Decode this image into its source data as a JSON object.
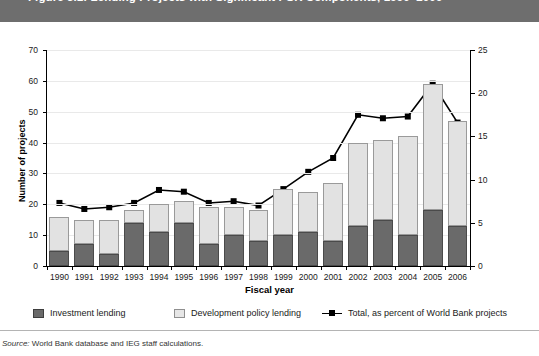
{
  "figure": {
    "title": "Figure 5.1: Lending Projects with Significant PSR Components, 1990–2006",
    "source_label": "Source:",
    "source_text": "World Bank database and IEG staff calculations."
  },
  "axes": {
    "x_title": "Fiscal year",
    "y_left_title": "Number of projects",
    "y_right_title": "Percent of Bank projects",
    "y_left_ticks": [
      "0",
      "10",
      "20",
      "30",
      "40",
      "50",
      "60",
      "70"
    ],
    "y_right_ticks": [
      "0",
      "5",
      "10",
      "15",
      "20",
      "25"
    ]
  },
  "legend": {
    "items": [
      {
        "label": "Investment lending",
        "marker": "square-swatch-dark",
        "color": "#6a6a6a"
      },
      {
        "label": "Development policy lending",
        "marker": "square-swatch-light",
        "color": "#e6e6e6"
      },
      {
        "label": "Total, as percent of World Bank projects",
        "marker": "line-with-square-marker",
        "color": "#000000"
      }
    ]
  },
  "chart_data": {
    "type": "bar",
    "title": "Figure 5.1: Lending Projects with Significant PSR Components, 1990–2006",
    "xlabel": "Fiscal year",
    "ylabel": "Number of projects",
    "y2label": "Percent of Bank projects",
    "ylim": [
      0,
      70
    ],
    "y2lim": [
      0,
      25
    ],
    "grid": true,
    "legend_position": "bottom",
    "stacked": true,
    "categories": [
      "1990",
      "1991",
      "1992",
      "1993",
      "1994",
      "1995",
      "1996",
      "1997",
      "1998",
      "1999",
      "2000",
      "2001",
      "2002",
      "2003",
      "2004",
      "2005",
      "2006"
    ],
    "series": [
      {
        "name": "Investment lending",
        "type": "bar",
        "axis": "left",
        "color": "#6a6a6a",
        "values": [
          5,
          7,
          4,
          14,
          11,
          14,
          7,
          10,
          8,
          10,
          11,
          8,
          13,
          15,
          10,
          18,
          13
        ]
      },
      {
        "name": "Development policy lending",
        "type": "bar",
        "axis": "left",
        "color": "#e2e2e2",
        "values": [
          11,
          8,
          11,
          4,
          9,
          7,
          12,
          9,
          10,
          15,
          13,
          19,
          27,
          26,
          32,
          41,
          34
        ]
      },
      {
        "name": "Total number of projects",
        "type": "bar-total",
        "axis": "left",
        "values": [
          16,
          15,
          15,
          18,
          20,
          21,
          19,
          19,
          18,
          25,
          24,
          27,
          40,
          41,
          42,
          59,
          47
        ]
      },
      {
        "name": "Total, as percent of World Bank projects",
        "type": "line",
        "axis": "right",
        "color": "#000000",
        "marker": "square",
        "values": [
          7.3,
          6.6,
          6.8,
          7.3,
          8.8,
          8.6,
          7.3,
          7.5,
          7.0,
          8.9,
          10.9,
          12.5,
          17.5,
          17.1,
          17.3,
          21.1,
          16.6
        ]
      }
    ]
  }
}
